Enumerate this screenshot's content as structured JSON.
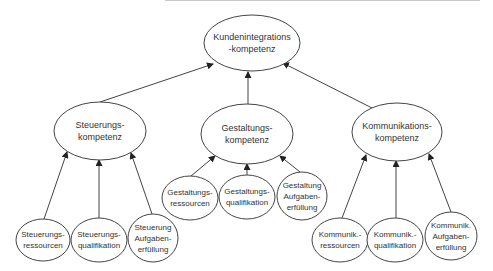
{
  "diagram": {
    "type": "hierarchy",
    "colors": {
      "stroke": "#444444",
      "text": "#333333",
      "background": "#ffffff",
      "top_line": "#c8c8c8"
    },
    "root": {
      "id": "root",
      "lines": [
        "Kundenintegrations",
        "-kompetenz"
      ],
      "cx": 252,
      "cy": 43,
      "rx": 48,
      "ry": 28,
      "font": 9
    },
    "level2": [
      {
        "id": "steuerung",
        "lines": [
          "Steuerungs-",
          "kompetenz"
        ],
        "cx": 100,
        "cy": 131,
        "rx": 46,
        "ry": 29,
        "font": 9
      },
      {
        "id": "gestaltung",
        "lines": [
          "Gestaltungs-",
          "kompetenz"
        ],
        "cx": 247,
        "cy": 134,
        "rx": 46,
        "ry": 30,
        "font": 9
      },
      {
        "id": "kommunikation",
        "lines": [
          "Kommunikations-",
          "kompetenz"
        ],
        "cx": 397,
        "cy": 132,
        "rx": 45,
        "ry": 29,
        "font": 9
      }
    ],
    "leaves": [
      {
        "id": "st-res",
        "parent": "steuerung",
        "lines": [
          "Steuerungs-",
          "ressourcen"
        ],
        "cx": 43,
        "cy": 240,
        "rx": 27,
        "ry": 21,
        "font": 8
      },
      {
        "id": "st-qual",
        "parent": "steuerung",
        "lines": [
          "Steuerungs-",
          "qualifikation"
        ],
        "cx": 99,
        "cy": 240,
        "rx": 28,
        "ry": 22,
        "font": 8
      },
      {
        "id": "st-auf",
        "parent": "steuerung",
        "lines": [
          "Steuerung",
          "Aufgaben-",
          "erfüllung"
        ],
        "cx": 153,
        "cy": 238,
        "rx": 25,
        "ry": 24,
        "font": 8
      },
      {
        "id": "ge-res",
        "parent": "gestaltung",
        "lines": [
          "Gestaltungs-",
          "ressourcen"
        ],
        "cx": 190,
        "cy": 198,
        "rx": 28,
        "ry": 22,
        "font": 8
      },
      {
        "id": "ge-qual",
        "parent": "gestaltung",
        "lines": [
          "Gestaltungs-",
          "qualifikation"
        ],
        "cx": 247,
        "cy": 197,
        "rx": 28,
        "ry": 22,
        "font": 8
      },
      {
        "id": "ge-auf",
        "parent": "gestaltung",
        "lines": [
          "Gestaltung",
          "Aufgaben-",
          "erfüllung"
        ],
        "cx": 302,
        "cy": 196,
        "rx": 25,
        "ry": 24,
        "font": 8
      },
      {
        "id": "ko-res",
        "parent": "kommunikation",
        "lines": [
          "Kommunik.-",
          "ressourcen"
        ],
        "cx": 340,
        "cy": 240,
        "rx": 28,
        "ry": 22,
        "font": 8
      },
      {
        "id": "ko-qual",
        "parent": "kommunikation",
        "lines": [
          "Kommunik.-",
          "qualifikation"
        ],
        "cx": 395,
        "cy": 240,
        "rx": 28,
        "ry": 22,
        "font": 8
      },
      {
        "id": "ko-auf",
        "parent": "kommunikation",
        "lines": [
          "Kommunik.",
          "Aufgaben-",
          "erfüllung"
        ],
        "cx": 451,
        "cy": 236,
        "rx": 26,
        "ry": 24,
        "font": 8
      }
    ],
    "edges": [
      {
        "from": "steuerung",
        "to": "root",
        "x1": 100,
        "y1": 102,
        "x2": 213,
        "y2": 64
      },
      {
        "from": "gestaltung",
        "to": "root",
        "x1": 248,
        "y1": 104,
        "x2": 248,
        "y2": 72
      },
      {
        "from": "kommunikation",
        "to": "root",
        "x1": 372,
        "y1": 108,
        "x2": 283,
        "y2": 63
      },
      {
        "from": "st-res",
        "to": "steuerung",
        "x1": 44,
        "y1": 219,
        "x2": 67,
        "y2": 152
      },
      {
        "from": "st-qual",
        "to": "steuerung",
        "x1": 99,
        "y1": 218,
        "x2": 99,
        "y2": 160
      },
      {
        "from": "st-auf",
        "to": "steuerung",
        "x1": 152,
        "y1": 214,
        "x2": 131,
        "y2": 153
      },
      {
        "from": "ge-res",
        "to": "gestaltung",
        "x1": 191,
        "y1": 176,
        "x2": 215,
        "y2": 156
      },
      {
        "from": "ge-qual",
        "to": "gestaltung",
        "x1": 247,
        "y1": 175,
        "x2": 247,
        "y2": 164
      },
      {
        "from": "ge-auf",
        "to": "gestaltung",
        "x1": 300,
        "y1": 172,
        "x2": 280,
        "y2": 156
      },
      {
        "from": "ko-res",
        "to": "kommunikation",
        "x1": 342,
        "y1": 218,
        "x2": 366,
        "y2": 155
      },
      {
        "from": "ko-qual",
        "to": "kommunikation",
        "x1": 396,
        "y1": 218,
        "x2": 396,
        "y2": 161
      },
      {
        "from": "ko-auf",
        "to": "kommunikation",
        "x1": 451,
        "y1": 212,
        "x2": 429,
        "y2": 154
      }
    ]
  }
}
